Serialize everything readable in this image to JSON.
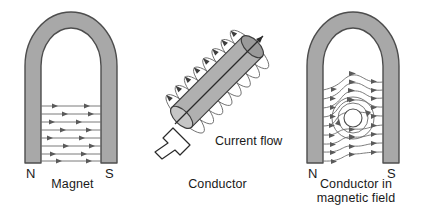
{
  "figure": {
    "background_color": "#ffffff",
    "ink_color": "#1a1a1a",
    "magnet_fill": "#a8a8a8",
    "magnet_stroke": "#4d4d4d",
    "fieldline_color": "#6b6b6b"
  },
  "panels": {
    "magnet": {
      "caption": "Magnet",
      "north_label": "N",
      "south_label": "S",
      "field_line_count": 8,
      "field_direction": "north-to-south"
    },
    "conductor": {
      "caption": "Conductor",
      "current_label": "Current flow",
      "loop_count": 8,
      "orientation": "diagonal"
    },
    "field": {
      "caption": "Conductor in\nmagnetic field",
      "north_label": "N",
      "south_label": "S",
      "field_line_count": 9,
      "conductor_ring_count": 3
    }
  }
}
